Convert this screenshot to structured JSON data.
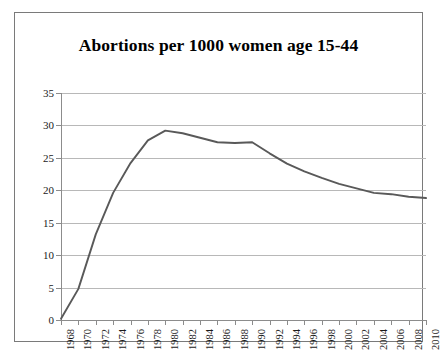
{
  "chart_data": {
    "type": "line",
    "title": "Abortions per 1000 women age 15-44",
    "xlabel": "",
    "ylabel": "",
    "ylim": [
      0,
      35
    ],
    "yticks": [
      0,
      5,
      10,
      15,
      20,
      25,
      30,
      35
    ],
    "xlim": [
      1968,
      2010
    ],
    "grid": true,
    "legend": false,
    "line_color": "#595959",
    "x": [
      1968,
      1970,
      1972,
      1974,
      1976,
      1978,
      1980,
      1982,
      1984,
      1986,
      1988,
      1990,
      1992,
      1994,
      1996,
      1998,
      2000,
      2002,
      2004,
      2006,
      2008,
      2010
    ],
    "xticklabels": [
      "1968",
      "1970",
      "1972",
      "1974",
      "1976",
      "1978",
      "1980",
      "1982",
      "1984",
      "1986",
      "1988",
      "1990",
      "1992",
      "1994",
      "1996",
      "1998",
      "2000",
      "2002",
      "2004",
      "2006",
      "2008",
      "2010"
    ],
    "values": [
      0.2,
      4.8,
      13.2,
      19.6,
      24.2,
      27.7,
      29.2,
      28.8,
      28.1,
      27.4,
      27.3,
      27.4,
      25.7,
      24.1,
      22.9,
      21.9,
      21.0,
      20.3,
      19.6,
      19.4,
      19.0,
      18.8
    ],
    "series": [
      {
        "name": "Abortions per 1000 women age 15-44",
        "values": [
          0.2,
          4.8,
          13.2,
          19.6,
          24.2,
          27.7,
          29.2,
          28.8,
          28.1,
          27.4,
          27.3,
          27.4,
          25.7,
          24.1,
          22.9,
          21.9,
          21.0,
          20.3,
          19.6,
          19.4,
          19.0,
          18.8
        ]
      }
    ]
  }
}
